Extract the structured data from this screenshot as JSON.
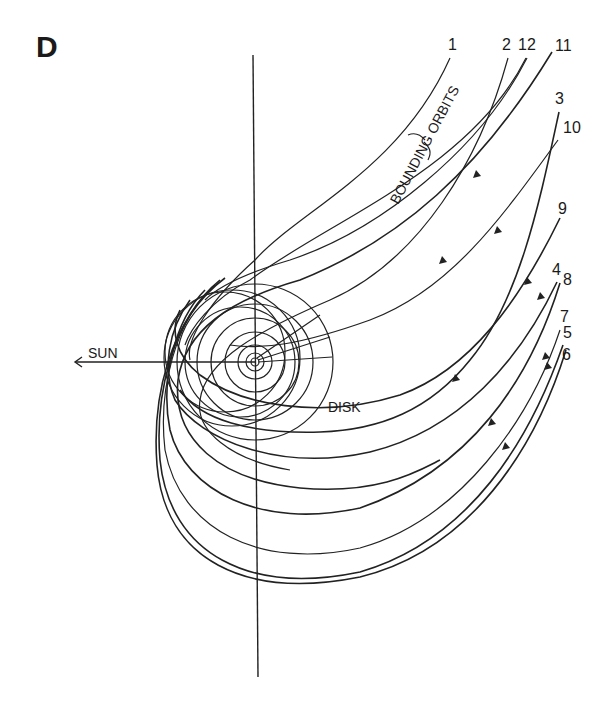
{
  "figure": {
    "panel_label": "D",
    "annotations": {
      "sun": "SUN",
      "disk": "DISK",
      "bounding_orbits": "BOUNDING ORBITS"
    },
    "orbit_labels": [
      {
        "id": "1",
        "text": "1",
        "x": 448,
        "y": 50
      },
      {
        "id": "2",
        "text": "2",
        "x": 502,
        "y": 50
      },
      {
        "id": "12",
        "text": "12",
        "x": 520,
        "y": 50
      },
      {
        "id": "11",
        "text": "11",
        "x": 556,
        "y": 51
      },
      {
        "id": "3",
        "text": "3",
        "x": 555,
        "y": 104
      },
      {
        "id": "10",
        "text": "10",
        "x": 564,
        "y": 133
      },
      {
        "id": "9",
        "text": "9",
        "x": 558,
        "y": 214
      },
      {
        "id": "4",
        "text": "4",
        "x": 553,
        "y": 276
      },
      {
        "id": "8",
        "text": "8",
        "x": 563,
        "y": 286
      },
      {
        "id": "7",
        "text": "7",
        "x": 560,
        "y": 322
      },
      {
        "id": "5",
        "text": "5",
        "x": 563,
        "y": 338
      },
      {
        "id": "6",
        "text": "6",
        "x": 562,
        "y": 360
      }
    ],
    "colors": {
      "ink": "#222222",
      "background": "#ffffff"
    }
  }
}
